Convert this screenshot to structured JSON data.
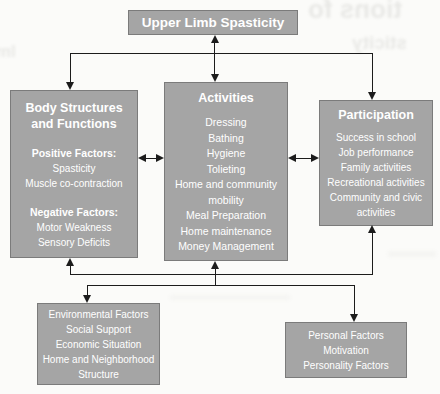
{
  "diagram": {
    "top_box": {
      "label": "Upper Limb Spasticity"
    },
    "body_structures_box": {
      "title": "Body Structures and Functions",
      "positive_heading": "Positive Factors:",
      "positive_items": [
        "Spasticity",
        "Muscle co-contraction"
      ],
      "negative_heading": "Negative Factors:",
      "negative_items": [
        "Motor Weakness",
        "Sensory Deficits"
      ]
    },
    "activities_box": {
      "title": "Activities",
      "items": [
        "Dressing",
        "Bathing",
        "Hygiene",
        "Tolieting",
        "Home and community mobility",
        "Meal Preparation",
        "Home maintenance",
        "Money Management"
      ]
    },
    "participation_box": {
      "title": "Participation",
      "items": [
        "Success in school",
        "Job performance",
        "Family activities",
        "Recreational activities",
        "Community and civic activities"
      ]
    },
    "environmental_box": {
      "items": [
        "Environmental Factors",
        "Social Support",
        "Economic Situation",
        "Home and Neighborhood Structure"
      ]
    },
    "personal_box": {
      "items": [
        "Personal Factors",
        "Motivation",
        "Personality Factors"
      ]
    },
    "colors": {
      "box_fill": "#a5a5a5",
      "box_border": "#7b7b7b",
      "connector_line": "#1c1c1c",
      "text": "#ffffff",
      "background": "#fbfbf9"
    },
    "artifacts": {
      "bleed_top_right_1": "tions fo",
      "bleed_top_right_2": "sticity",
      "bleed_left_edge": "lm"
    }
  }
}
